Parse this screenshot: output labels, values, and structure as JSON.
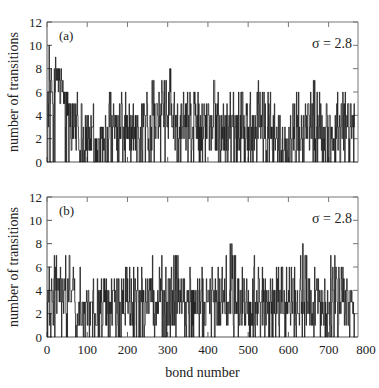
{
  "chart_data": [
    {
      "type": "line",
      "style": "step",
      "panel_label": "(a)",
      "annotation": "σ = 2.8",
      "xlabel": "",
      "ylabel": "number of transitions",
      "xlim": [
        0,
        800
      ],
      "ylim": [
        0,
        12
      ],
      "xticks": [
        0,
        100,
        200,
        300,
        400,
        500,
        600,
        700,
        800
      ],
      "yticks": [
        0,
        2,
        4,
        6,
        8,
        10,
        12
      ],
      "ytick_labels": [
        "0",
        "2",
        "4",
        "6",
        "8",
        "10",
        "12"
      ],
      "grid": false,
      "n_points": 765,
      "sample_every": 10,
      "levels_10": [
        5,
        6,
        7,
        6,
        5,
        4,
        3,
        3,
        2,
        2,
        2,
        2,
        1,
        1,
        1,
        2,
        2,
        3,
        4,
        3,
        3,
        3,
        2,
        3,
        3,
        2,
        3,
        4,
        4,
        4,
        4,
        3,
        3,
        3,
        3,
        3,
        3,
        3,
        2,
        3,
        3,
        3,
        3,
        2,
        2,
        3,
        3,
        3,
        3,
        3,
        3,
        3,
        4,
        3,
        3,
        3,
        2,
        2,
        1,
        1,
        1,
        1,
        2,
        2,
        3,
        3,
        3,
        3,
        2,
        2,
        2,
        2,
        3,
        3,
        3,
        3,
        3
      ],
      "peaks_10": [
        10,
        8,
        9,
        8,
        6,
        6,
        6,
        6,
        5,
        4,
        4,
        5,
        3,
        3,
        4,
        6,
        6,
        6,
        6,
        6,
        6,
        5,
        6,
        6,
        6,
        6,
        7,
        8,
        7,
        8,
        8,
        6,
        6,
        6,
        6,
        6,
        6,
        6,
        5,
        6,
        7,
        7,
        6,
        6,
        5,
        6,
        6,
        6,
        6,
        5,
        6,
        7,
        7,
        6,
        6,
        6,
        5,
        4,
        3,
        4,
        4,
        5,
        6,
        5,
        6,
        6,
        7,
        6,
        5,
        5,
        5,
        6,
        7,
        6,
        6,
        6,
        6
      ],
      "color": "#1a1a1a"
    },
    {
      "type": "line",
      "style": "step",
      "panel_label": "(b)",
      "annotation": "σ = 2.8",
      "xlabel": "bond number",
      "ylabel": "number of transitions",
      "xlim": [
        0,
        800
      ],
      "ylim": [
        0,
        12
      ],
      "xticks": [
        0,
        100,
        200,
        300,
        400,
        500,
        600,
        700,
        800
      ],
      "xtick_labels": [
        "0",
        "100",
        "200",
        "300",
        "400",
        "500",
        "600",
        "700",
        "800"
      ],
      "yticks": [
        0,
        2,
        4,
        6,
        8,
        10,
        12
      ],
      "ytick_labels": [
        "0",
        "2",
        "4",
        "6",
        "8",
        "10",
        "12"
      ],
      "grid": false,
      "n_points": 765,
      "sample_every": 10,
      "levels_10": [
        2,
        3,
        4,
        4,
        3,
        3,
        3,
        2,
        2,
        2,
        2,
        2,
        2,
        2,
        3,
        3,
        3,
        2,
        2,
        3,
        3,
        3,
        3,
        3,
        2,
        3,
        3,
        3,
        3,
        2,
        3,
        3,
        3,
        3,
        2,
        3,
        3,
        3,
        3,
        3,
        3,
        3,
        3,
        3,
        3,
        3,
        3,
        3,
        3,
        3,
        2,
        3,
        3,
        3,
        3,
        2,
        3,
        3,
        3,
        3,
        3,
        3,
        3,
        3,
        3,
        3,
        3,
        3,
        3,
        3,
        3,
        4,
        3,
        3,
        3,
        3,
        2
      ],
      "peaks_10": [
        6,
        7,
        8,
        10,
        7,
        7,
        6,
        8,
        6,
        5,
        7,
        5,
        6,
        5,
        6,
        6,
        5,
        6,
        5,
        6,
        6,
        6,
        6,
        6,
        5,
        5,
        7,
        6,
        7,
        6,
        6,
        7,
        7,
        6,
        5,
        6,
        6,
        6,
        6,
        6,
        5,
        6,
        6,
        6,
        7,
        8,
        7,
        6,
        6,
        6,
        5,
        7,
        6,
        6,
        5,
        5,
        6,
        6,
        6,
        6,
        6,
        6,
        5,
        8,
        7,
        6,
        6,
        6,
        6,
        7,
        7,
        7,
        6,
        6,
        5,
        4,
        4
      ],
      "color": "#1a1a1a"
    }
  ]
}
